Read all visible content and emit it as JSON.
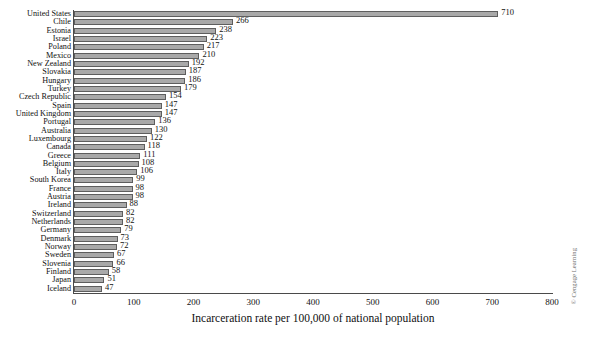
{
  "chart_data": {
    "type": "bar",
    "orientation": "horizontal",
    "title": "",
    "xlabel": "Incarceration rate per 100,000 of national population",
    "ylabel": "",
    "xlim": [
      0,
      800
    ],
    "xticks": [
      0,
      100,
      200,
      300,
      400,
      500,
      600,
      700,
      800
    ],
    "grid": false,
    "legend": null,
    "categories": [
      "United States",
      "Chile",
      "Estonia",
      "Israel",
      "Poland",
      "Mexico",
      "New Zealand",
      "Slovakia",
      "Hungary",
      "Turkey",
      "Czech Republic",
      "Spain",
      "United Kingdom",
      "Portugal",
      "Australia",
      "Luxembourg",
      "Canada",
      "Greece",
      "Belgium",
      "Italy",
      "South Korea",
      "France",
      "Austria",
      "Ireland",
      "Switzerland",
      "Netherlands",
      "Germany",
      "Denmark",
      "Norway",
      "Sweden",
      "Slovenia",
      "Finland",
      "Japan",
      "Iceland"
    ],
    "values": [
      710,
      266,
      238,
      223,
      217,
      210,
      192,
      187,
      186,
      179,
      154,
      147,
      147,
      136,
      130,
      122,
      118,
      111,
      108,
      106,
      99,
      98,
      98,
      88,
      82,
      82,
      79,
      73,
      72,
      67,
      66,
      58,
      51,
      47
    ],
    "bar_color": "#a9a9a9",
    "bar_edge_color": "#5e5e5e",
    "axis_color": "#4a4a4a",
    "background": "#ffffff"
  },
  "credit": "© Cengage Learning"
}
